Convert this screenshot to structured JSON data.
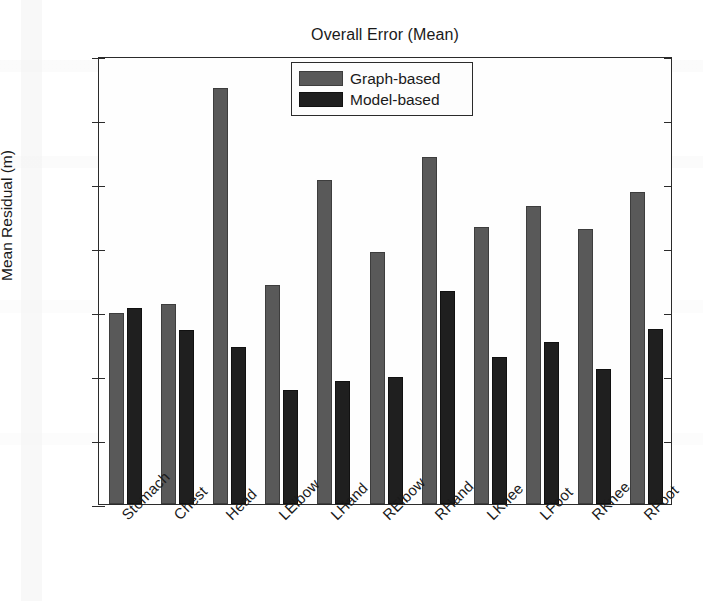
{
  "chart_data": {
    "type": "bar",
    "title": "Overall Error (Mean)",
    "xlabel": "",
    "ylabel": "Mean Residual (m)",
    "ylim": [
      0,
      0.14
    ],
    "yticks": [
      0,
      0.02,
      0.04,
      0.06,
      0.08,
      0.1,
      0.12,
      0.14
    ],
    "ytick_labels": [
      "0",
      "0.02",
      "0.04",
      "0.06",
      "0.08",
      "0.1",
      "0.12",
      "0.14"
    ],
    "grid": false,
    "legend_position": "top-center",
    "categories": [
      "Stomach",
      "Chest",
      "Head",
      "LElbow",
      "LHand",
      "RElbow",
      "RHand",
      "LKnee",
      "LFoot",
      "RKnee",
      "RFoot"
    ],
    "series": [
      {
        "name": "Graph-based",
        "color": "#595959",
        "values": [
          0.0598,
          0.0625,
          0.13,
          0.0685,
          0.1012,
          0.0789,
          0.1085,
          0.0865,
          0.0932,
          0.0858,
          0.0975
        ]
      },
      {
        "name": "Model-based",
        "color": "#1f1f1f",
        "values": [
          0.0614,
          0.0545,
          0.0492,
          0.0355,
          0.0385,
          0.0398,
          0.0665,
          0.0458,
          0.0505,
          0.0423,
          0.0548
        ]
      }
    ]
  }
}
